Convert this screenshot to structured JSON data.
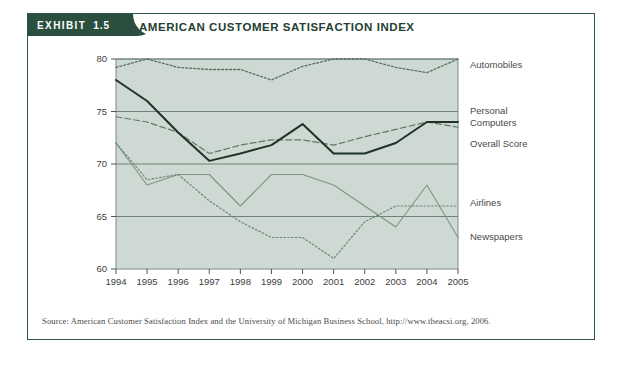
{
  "exhibit": {
    "tab_word": "EXHIBIT",
    "tab_number": "1.5",
    "title": "AMERICAN CUSTOMER SATISFACTION INDEX",
    "source": "Source: American Customer Satisfaction Index and the University of Michigan Business School, http://www.theacsi.org, 2006."
  },
  "colors": {
    "tab_background": "#2a4f3f",
    "title_text": "#24402f",
    "plot_background": "#cdd9d2",
    "plot_border": "#7d8f86",
    "gridline": "#6e8279",
    "overall_score": "#1d3329",
    "personal_computers": "#5c7a6c",
    "automobiles": "#5a6f66",
    "airlines": "#7e9489",
    "newspapers": "#6d857a"
  },
  "chart_data": {
    "type": "line",
    "title": "AMERICAN CUSTOMER SATISFACTION INDEX",
    "xlabel": "",
    "ylabel": "",
    "x": [
      1994,
      1995,
      1996,
      1997,
      1998,
      1999,
      2000,
      2001,
      2002,
      2003,
      2004,
      2005
    ],
    "categories": [
      "1994",
      "1995",
      "1996",
      "1997",
      "1998",
      "1999",
      "2000",
      "2001",
      "2002",
      "2003",
      "2004",
      "2005"
    ],
    "ylim": [
      60,
      80
    ],
    "yticks": [
      60,
      65,
      70,
      75,
      80
    ],
    "grid": true,
    "legend_position": "right",
    "series": [
      {
        "name": "Automobiles",
        "style": "dotted",
        "values": [
          79.2,
          80.0,
          79.2,
          79.0,
          79.0,
          78.0,
          79.3,
          80.0,
          80.0,
          79.2,
          78.7,
          80.0
        ]
      },
      {
        "name": "Personal Computers",
        "style": "dashed",
        "values": [
          74.5,
          74.0,
          73.0,
          71.0,
          71.8,
          72.3,
          72.3,
          71.8,
          72.6,
          73.3,
          74.0,
          73.5
        ]
      },
      {
        "name": "Overall Score",
        "style": "solid-bold",
        "values": [
          78.0,
          76.0,
          73.0,
          70.3,
          71.0,
          71.8,
          73.8,
          71.0,
          71.0,
          72.0,
          74.0,
          74.0
        ]
      },
      {
        "name": "Airlines",
        "style": "solid-thin",
        "values": [
          72.0,
          68.0,
          69.0,
          69.0,
          66.0,
          69.0,
          69.0,
          68.0,
          66.0,
          64.0,
          68.0,
          63.0
        ]
      },
      {
        "name": "Newspapers",
        "style": "dotted-thin",
        "values": [
          72.0,
          68.5,
          69.0,
          66.5,
          64.5,
          63.0,
          63.0,
          61.0,
          64.5,
          66.0,
          66.0,
          66.0
        ]
      }
    ]
  }
}
